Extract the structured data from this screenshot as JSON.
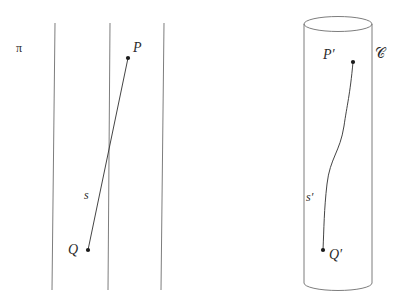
{
  "figure": {
    "background_color": "#ffffff",
    "stroke_color": "#6e6e6e",
    "curve_color": "#3a3a3a",
    "dot_color": "#1a1a1a",
    "width": 399,
    "height": 305
  },
  "left_panel": {
    "name": "plane-diagram",
    "plane_label": "π",
    "point_p_label": "P",
    "point_q_label": "Q",
    "segment_label": "s",
    "ruling_line_count": 3
  },
  "right_panel": {
    "name": "cylinder-diagram",
    "surface_label": "𝒞",
    "point_p_prime_label": "P′",
    "point_q_prime_label": "Q′",
    "curve_label": "s′"
  },
  "geometry": {
    "plane_lines": [
      {
        "x1": 55,
        "y1": 23,
        "x2": 52,
        "y2": 290
      },
      {
        "x1": 110,
        "y1": 23,
        "x2": 108,
        "y2": 290
      },
      {
        "x1": 164,
        "y1": 23,
        "x2": 161,
        "y2": 290
      }
    ],
    "segment_s": {
      "x1": 128,
      "y1": 58,
      "x2": 88,
      "y2": 250
    },
    "point_p": {
      "x": 128,
      "y": 58,
      "r": 2.1
    },
    "point_q": {
      "x": 88,
      "y": 250,
      "r": 2.1
    },
    "cylinder": {
      "left_x": 304,
      "right_x": 372,
      "top_y": 24,
      "bottom_y": 290,
      "rx": 34,
      "ry": 7.5
    },
    "curve_s_prime": "M 353 62 C 350 95 347 105 344 126 C 340 152 330 158 327 184 C 324 210 324 228 323 250",
    "point_p_prime": {
      "x": 353,
      "y": 62,
      "r": 2.1
    },
    "point_q_prime": {
      "x": 323,
      "y": 250,
      "r": 2.1
    }
  },
  "label_positions": {
    "plane": {
      "left": 16,
      "top": 42
    },
    "p": {
      "left": 133,
      "top": 41
    },
    "q": {
      "left": 68,
      "top": 243
    },
    "s": {
      "left": 84,
      "top": 189
    },
    "surface": {
      "left": 375,
      "top": 46
    },
    "p_prime": {
      "left": 323,
      "top": 48
    },
    "q_prime": {
      "left": 329,
      "top": 248
    },
    "s_prime": {
      "left": 306,
      "top": 191
    }
  }
}
